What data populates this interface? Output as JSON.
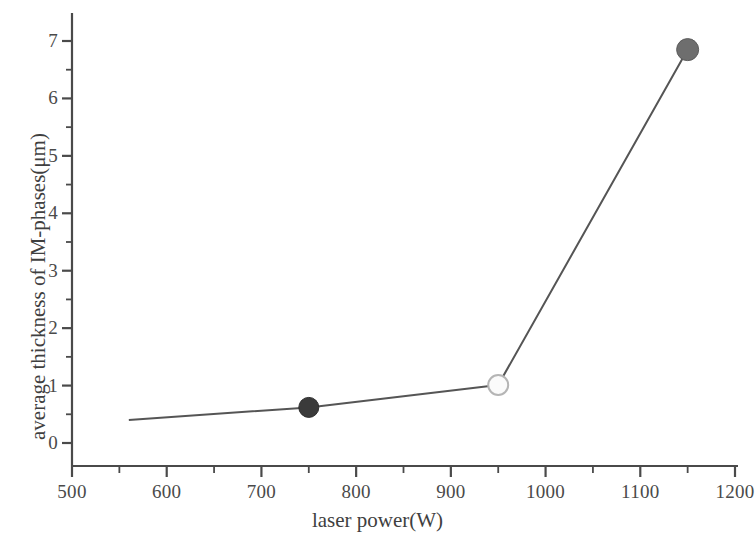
{
  "chart_data": {
    "type": "line",
    "title": "",
    "subtitle": "",
    "xlabel": "laser power(W)",
    "ylabel": "average thickness of IM-phases(μm)",
    "xlim": [
      500,
      1200
    ],
    "ylim": [
      0,
      7
    ],
    "x_major_step": 100,
    "x_minor_step": 50,
    "y_major_step": 1,
    "y_minor_step": 0.5,
    "grid": false,
    "legend": false,
    "legend_position": "none",
    "x_ticks": [
      "500",
      "600",
      "700",
      "800",
      "900",
      "1000",
      "1100",
      "1200"
    ],
    "y_ticks": [
      "0",
      "1",
      "2",
      "3",
      "4",
      "5",
      "6",
      "7"
    ],
    "series": [
      {
        "name": "average thickness of IM-phases",
        "x": [
          560,
          750,
          950,
          1150
        ],
        "values": [
          0.4,
          0.62,
          1.01,
          6.85
        ],
        "line_color": "#555555",
        "markers": [
          {
            "x": 560,
            "y": 0.4,
            "style": "none",
            "fill": "none",
            "stroke": "none",
            "radius": 0
          },
          {
            "x": 750,
            "y": 0.62,
            "style": "filled-circle",
            "fill": "#3a3a3a",
            "stroke": "#2e2e2e",
            "radius": 10
          },
          {
            "x": 950,
            "y": 1.01,
            "style": "open-circle",
            "fill": "#fbfbfb",
            "stroke": "#b5b5b5",
            "radius": 10
          },
          {
            "x": 1150,
            "y": 6.85,
            "style": "filled-circle",
            "fill": "#6e6e6e",
            "stroke": "#5c5c5c",
            "radius": 11
          }
        ]
      }
    ],
    "colors": {
      "axis": "#4a4a4a",
      "line": "#555555",
      "text": "#3f3f3f",
      "background": "#ffffff"
    }
  }
}
